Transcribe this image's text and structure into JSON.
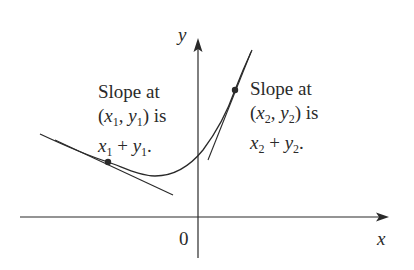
{
  "axes": {
    "x_label": "x",
    "y_label": "y",
    "origin_label": "0"
  },
  "annotations": {
    "point1": {
      "line1": "Slope at",
      "line2_open": "(",
      "line2_x": "x",
      "line2_xsub": "1",
      "line2_comma": ", ",
      "line2_y": "y",
      "line2_ysub": "1",
      "line2_close": ") is",
      "line3_x": "x",
      "line3_xsub": "1",
      "line3_plus": " + ",
      "line3_y": "y",
      "line3_ysub": "1",
      "line3_end": "."
    },
    "point2": {
      "line1": "Slope at",
      "line2_open": "(",
      "line2_x": "x",
      "line2_xsub": "2",
      "line2_comma": ", ",
      "line2_y": "y",
      "line2_ysub": "2",
      "line2_close": ") is",
      "line3_x": "x",
      "line3_xsub": "2",
      "line3_plus": " + ",
      "line3_y": "y",
      "line3_ysub": "2",
      "line3_end": "."
    }
  },
  "colors": {
    "ink": "#2a2a2a",
    "background": "#ffffff"
  }
}
